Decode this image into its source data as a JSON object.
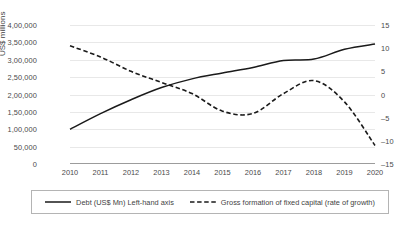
{
  "chart_data": {
    "type": "line",
    "title": "",
    "subtitle": "",
    "xlabel": "",
    "ylabel": "US$ millions",
    "y2label": "",
    "categories": [
      "2010",
      "2011",
      "2012",
      "2013",
      "2014",
      "2015",
      "2016",
      "2017",
      "2018",
      "2019",
      "2020"
    ],
    "ylim": [
      0,
      400000
    ],
    "y2lim": [
      -15,
      15
    ],
    "yticks": [
      0,
      50000,
      100000,
      150000,
      200000,
      250000,
      300000,
      350000,
      400000
    ],
    "ytick_labels": [
      "0",
      "50,000",
      "1,00,000",
      "1,50,000",
      "2,00,000",
      "2,50,000",
      "3,00,000",
      "3,50,000",
      "4,00,000"
    ],
    "y2ticks": [
      -15,
      -10,
      -5,
      0,
      5,
      10,
      15
    ],
    "y2tick_labels": [
      "–15",
      "–10",
      "–5",
      "0",
      "5",
      "10",
      "15"
    ],
    "grid": true,
    "legend_position": "bottom",
    "series": [
      {
        "name": "Debt (US$ Mn) Left-hand axis",
        "axis": "left",
        "style": "solid",
        "color": "#1a1a1a",
        "values": [
          100000,
          145000,
          185000,
          220000,
          245000,
          262000,
          278000,
          298000,
          302000,
          330000,
          345000
        ]
      },
      {
        "name": "Gross formation of fixed capital (rate of growth)",
        "axis": "right",
        "style": "dashed",
        "color": "#1a1a1a",
        "values": [
          10.5,
          8.1,
          5.0,
          2.6,
          0.2,
          -3.6,
          -4.1,
          0.2,
          3.0,
          -1.6,
          -11.0
        ]
      }
    ]
  },
  "legend": {
    "entries": [
      {
        "label": "Debt (US$ Mn) Left-hand axis",
        "style": "solid"
      },
      {
        "label": "Gross formation of fixed capital (rate of growth)",
        "style": "dashed"
      }
    ]
  }
}
